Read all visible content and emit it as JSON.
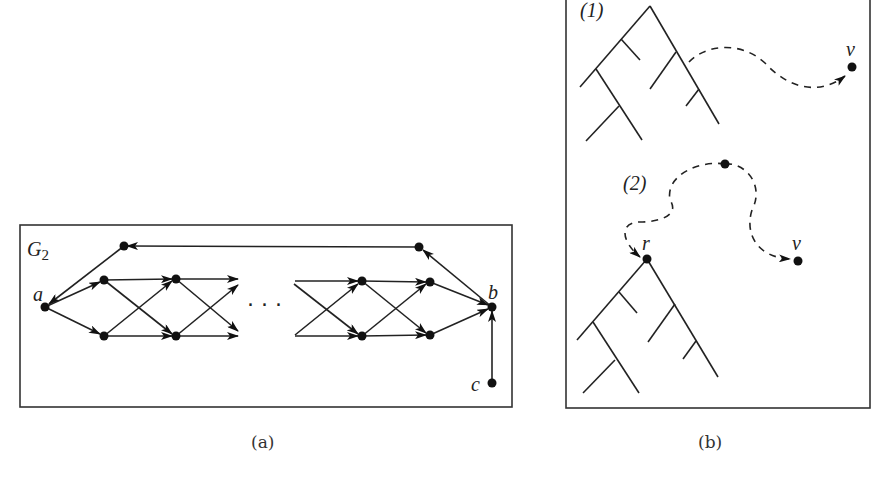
{
  "panel_a": {
    "graph_label": "G",
    "graph_subscript": "2",
    "node_labels": {
      "a": "a",
      "b": "b",
      "c": "c"
    },
    "ellipsis": "· · ·",
    "caption": "(a)"
  },
  "panel_b": {
    "part1_label": "(1)",
    "part2_label": "(2)",
    "v_label_1": "v",
    "v_label_2": "v",
    "r_label": "r",
    "caption": "(b)"
  }
}
